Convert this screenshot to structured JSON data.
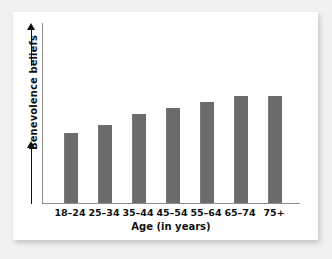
{
  "chart_data": {
    "type": "bar",
    "title": "",
    "subtitle": "",
    "xlabel": "Age (in years)",
    "ylabel": "Benevolence beliefs",
    "categories": [
      "18–24",
      "25–34",
      "35–44",
      "45–54",
      "55–64",
      "65–74",
      "75+"
    ],
    "values": [
      70,
      78,
      89,
      95,
      101,
      107,
      107
    ],
    "value_units": "relative bar height (pixels); y-axis is unlabeled/unscaled",
    "ylim": [
      0,
      180
    ],
    "y_axis_ticks": [],
    "x_axis_ticks": [
      "18–24",
      "25–34",
      "35–44",
      "45–54",
      "55–64",
      "65–74",
      "75+"
    ],
    "grid": false,
    "legend": null,
    "legend_position": "none",
    "annotations": [],
    "bar_color": "#6b6b6b",
    "axis_color": "#8d8d8d",
    "text_color": "#111111",
    "background_color": "#ffffff",
    "page_background_color": "#f1f1f1",
    "y_axis_direction_arrows": "up"
  },
  "figure": {
    "card_background": "#ffffff"
  }
}
